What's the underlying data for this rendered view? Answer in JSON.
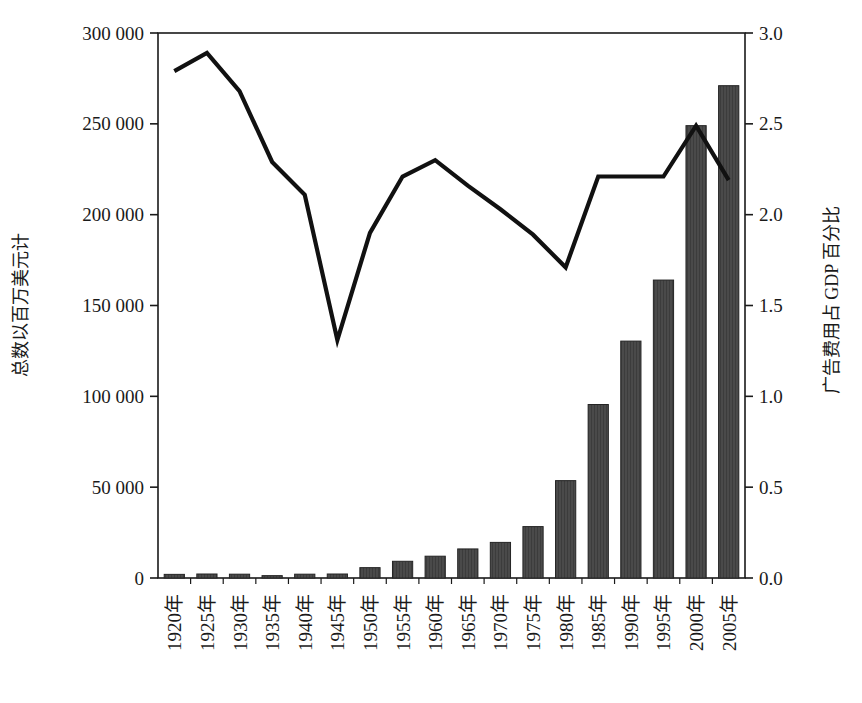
{
  "chart_data": {
    "type": "bar",
    "title": "",
    "subtitle": "",
    "xlabel": "",
    "ylabel": "总数以百万美元计",
    "y2label": "广告费用占 GDP 百分比",
    "grid": false,
    "legend": "none",
    "categories": [
      "1920年",
      "1925年",
      "1930年",
      "1935年",
      "1940年",
      "1945年",
      "1950年",
      "1955年",
      "1960年",
      "1965年",
      "1970年",
      "1975年",
      "1980年",
      "1985年",
      "1990年",
      "1995年",
      "2000年",
      "2005年"
    ],
    "ylim": [
      0,
      300000
    ],
    "yticks": [
      0,
      50000,
      100000,
      150000,
      200000,
      250000,
      300000
    ],
    "ytick_labels": [
      "0",
      "50 000",
      "100 000",
      "150 000",
      "200 000",
      "250 000",
      "300 000"
    ],
    "y2lim": [
      0,
      3.0
    ],
    "y2ticks": [
      0.0,
      0.5,
      1.0,
      1.5,
      2.0,
      2.5,
      3.0
    ],
    "y2tick_labels": [
      "0.0",
      "0.5",
      "1.0",
      "1.5",
      "2.0",
      "2.5",
      "3.0"
    ],
    "series": [
      {
        "name": "总数以百万美元计",
        "type": "bar",
        "axis": "left",
        "color": "#4a4a4a",
        "values": [
          2000,
          2200,
          2100,
          1300,
          2100,
          2200,
          5700,
          9200,
          12000,
          16000,
          19600,
          28300,
          53600,
          95500,
          130400,
          164000,
          249000,
          271000
        ]
      },
      {
        "name": "广告费用占 GDP 百分比",
        "type": "line",
        "axis": "right",
        "color": "#111111",
        "values": [
          2.79,
          2.89,
          2.68,
          2.29,
          2.11,
          1.31,
          1.9,
          2.21,
          2.3,
          2.16,
          2.03,
          1.89,
          1.71,
          2.21,
          2.21,
          2.21,
          2.49,
          2.19
        ]
      }
    ]
  },
  "axes": {
    "left_title": "总数以百万美元计",
    "right_title": "广告费用占 GDP 百分比"
  }
}
